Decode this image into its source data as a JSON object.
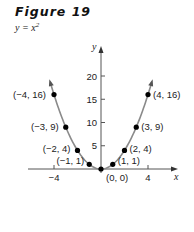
{
  "figure": {
    "title": "Figure 19",
    "equation_base": "y = x",
    "equation_exp": "2"
  },
  "chart_data": {
    "type": "line",
    "title": "Figure 19",
    "subtitle": "y = x^2",
    "xlabel": "x",
    "ylabel": "y",
    "x_ticks": [
      -4,
      4
    ],
    "x_tick_labels": [
      "−4",
      "4"
    ],
    "y_ticks": [
      5,
      10,
      15,
      20
    ],
    "y_tick_labels": [
      "5",
      "10",
      "15",
      "20"
    ],
    "xlim": [
      -5.5,
      5.5
    ],
    "ylim": [
      0,
      22
    ],
    "grid": false,
    "series": [
      {
        "name": "y = x^2",
        "x": [
          -4,
          -3,
          -2,
          -1,
          0,
          1,
          2,
          3,
          4
        ],
        "y": [
          16,
          9,
          4,
          1,
          0,
          1,
          4,
          9,
          16
        ]
      }
    ],
    "point_labels": [
      "(−4, 16)",
      "(−3, 9)",
      "(−2, 4)",
      "(−1, 1)",
      "(0, 0)",
      "(1, 1)",
      "(2, 4)",
      "(3, 9)",
      "(4, 16)"
    ],
    "colors": {
      "curve": "#8a8a8a",
      "points": "#000000",
      "axes": "#555555"
    }
  }
}
